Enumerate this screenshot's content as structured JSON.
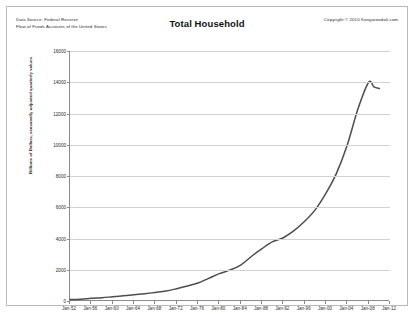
{
  "header": {
    "source_line1": "Data Source: Federal Reserve",
    "source_line2": "Flow of Funds  Accounts of the United States",
    "copyright": "Copyright © 2010 Kangaroodali.com"
  },
  "chart_data": {
    "type": "line",
    "title": "Total Household",
    "xlabel": "",
    "ylabel": "Billions of Dollars, seasonally adjusted quarterly values",
    "ylim": [
      0,
      16000
    ],
    "yticks": [
      0,
      2000,
      4000,
      6000,
      8000,
      10000,
      12000,
      14000,
      16000
    ],
    "ytick_labels": [
      "0",
      "2000",
      "4000",
      "6000",
      "8000",
      "10000",
      "12000",
      "14000",
      "16000"
    ],
    "grid": true,
    "legend": "none",
    "xlim": [
      "Jan-52",
      "Jan-12"
    ],
    "categories": [
      "Jan-52",
      "Jan-56",
      "Jan-60",
      "Jan-64",
      "Jan-68",
      "Jan-72",
      "Jan-76",
      "Jan-80",
      "Jan-84",
      "Jan-88",
      "Jan-92",
      "Jan-96",
      "Jan-00",
      "Jan-04",
      "Jan-08",
      "Jan-12"
    ],
    "xtick_labels": [
      "Jan-52",
      "Jan-56",
      "Jan-60",
      "Jan-64",
      "Jan-68",
      "Jan-72",
      "Jan-76",
      "Jan-80",
      "Jan-84",
      "Jan-88",
      "Jan-92",
      "Jan-96",
      "Jan-00",
      "Jan-04",
      "Jan-08",
      "Jan-12"
    ],
    "series": [
      {
        "name": "Total Household",
        "color": "#4d4d4d",
        "x": [
          1952,
          1954,
          1956,
          1958,
          1960,
          1962,
          1964,
          1966,
          1968,
          1970,
          1972,
          1974,
          1976,
          1978,
          1980,
          1982,
          1984,
          1986,
          1988,
          1990,
          1992,
          1994,
          1996,
          1998,
          2000,
          2002,
          2004,
          2006,
          2008,
          2009,
          2010
        ],
        "values": [
          90,
          120,
          170,
          210,
          270,
          330,
          400,
          470,
          550,
          640,
          790,
          960,
          1150,
          1450,
          1750,
          1980,
          2300,
          2850,
          3350,
          3800,
          4050,
          4500,
          5100,
          5850,
          6900,
          8200,
          10000,
          12300,
          14000,
          13700,
          13600
        ]
      }
    ],
    "peak": {
      "value": 14000,
      "year": 2008
    },
    "end": {
      "value": 13600,
      "year": 2010
    }
  }
}
